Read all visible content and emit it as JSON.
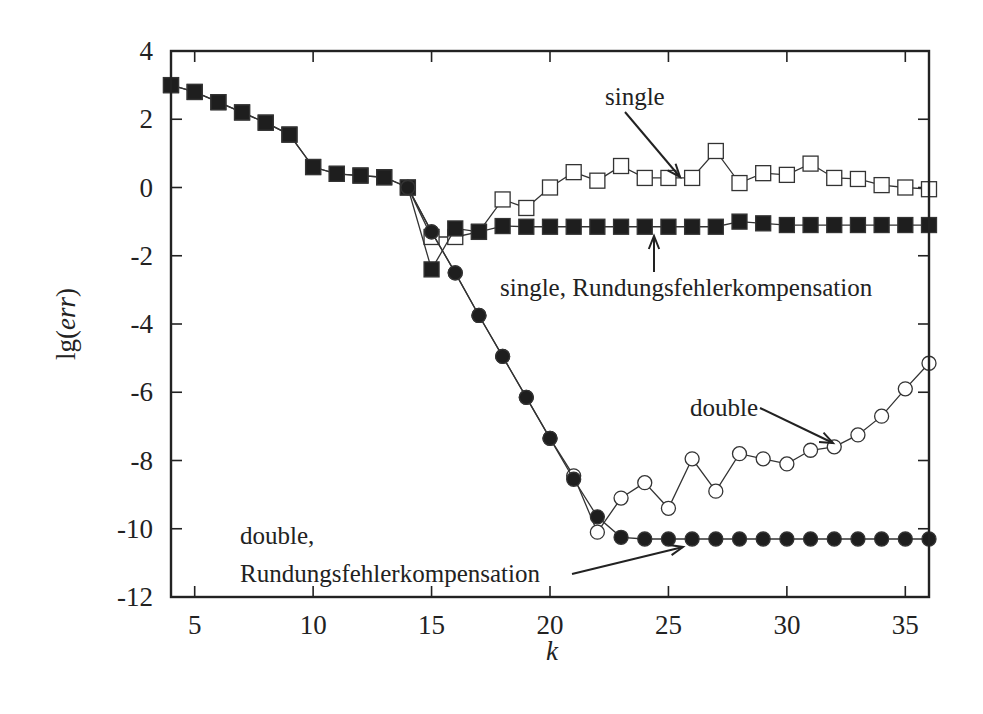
{
  "chart_data": {
    "type": "line",
    "title": "",
    "xlabel": "k",
    "ylabel": "lg(err)",
    "xlim": [
      4,
      36
    ],
    "ylim": [
      -12,
      4
    ],
    "xticks": [
      5,
      10,
      15,
      20,
      25,
      30,
      35
    ],
    "yticks": [
      4,
      2,
      0,
      -2,
      -4,
      -6,
      -8,
      -10,
      -12
    ],
    "grid": false,
    "legend": "none (inline annotations with arrows)",
    "series": [
      {
        "name": "single",
        "marker": "open-square",
        "x": [
          4,
          5,
          6,
          7,
          8,
          9,
          10,
          11,
          12,
          13,
          14,
          15,
          16,
          17,
          18,
          19,
          20,
          21,
          22,
          23,
          24,
          25,
          26,
          27,
          28,
          29,
          30,
          31,
          32,
          33,
          34,
          35,
          36
        ],
        "values": [
          3.0,
          2.8,
          2.5,
          2.2,
          1.9,
          1.55,
          0.6,
          0.4,
          0.35,
          0.3,
          0.0,
          -1.45,
          -1.45,
          -1.3,
          -0.35,
          -0.6,
          0.0,
          0.45,
          0.2,
          0.63,
          0.28,
          0.28,
          0.28,
          1.07,
          0.13,
          0.42,
          0.37,
          0.7,
          0.28,
          0.25,
          0.07,
          0.0,
          -0.05
        ]
      },
      {
        "name": "single, Rundungsfehlerkompensation",
        "marker": "filled-square",
        "x": [
          4,
          5,
          6,
          7,
          8,
          9,
          10,
          11,
          12,
          13,
          14,
          15,
          16,
          17,
          18,
          19,
          20,
          21,
          22,
          23,
          24,
          25,
          26,
          27,
          28,
          29,
          30,
          31,
          32,
          33,
          34,
          35,
          36
        ],
        "values": [
          3.0,
          2.8,
          2.5,
          2.2,
          1.9,
          1.55,
          0.6,
          0.4,
          0.35,
          0.3,
          0.0,
          -2.4,
          -1.2,
          -1.3,
          -1.13,
          -1.15,
          -1.15,
          -1.15,
          -1.15,
          -1.15,
          -1.15,
          -1.15,
          -1.15,
          -1.15,
          -1.0,
          -1.05,
          -1.1,
          -1.1,
          -1.1,
          -1.1,
          -1.1,
          -1.1,
          -1.1
        ]
      },
      {
        "name": "double",
        "marker": "open-circle",
        "x": [
          14,
          15,
          16,
          17,
          18,
          19,
          20,
          21,
          22,
          23,
          24,
          25,
          26,
          27,
          28,
          29,
          30,
          31,
          32,
          33,
          34,
          35,
          36
        ],
        "values": [
          0.0,
          -1.3,
          -2.5,
          -3.75,
          -4.95,
          -6.15,
          -7.35,
          -8.45,
          -10.1,
          -9.1,
          -8.65,
          -9.4,
          -7.95,
          -8.9,
          -7.8,
          -7.95,
          -8.1,
          -7.7,
          -7.6,
          -7.25,
          -6.7,
          -5.9,
          -5.15
        ]
      },
      {
        "name": "double, Rundungsfehlerkompensation",
        "marker": "filled-circle",
        "x": [
          14,
          15,
          16,
          17,
          18,
          19,
          20,
          21,
          22,
          23,
          24,
          25,
          26,
          27,
          28,
          29,
          30,
          31,
          32,
          33,
          34,
          35,
          36
        ],
        "values": [
          0.0,
          -1.3,
          -2.5,
          -3.75,
          -4.95,
          -6.15,
          -7.35,
          -8.55,
          -9.65,
          -10.25,
          -10.3,
          -10.3,
          -10.3,
          -10.3,
          -10.3,
          -10.3,
          -10.3,
          -10.3,
          -10.3,
          -10.3,
          -10.3,
          -10.3,
          -10.3
        ]
      }
    ],
    "annotations": [
      {
        "text": "single",
        "text_pos": [
          605,
          105
        ],
        "arrow_from": [
          625,
          112
        ],
        "arrow_to": [
          680,
          177
        ]
      },
      {
        "text": "single, Rundungsfehlerkompensation",
        "text_pos": [
          500,
          296
        ],
        "arrow_from": [
          654,
          272
        ],
        "arrow_to": [
          654,
          236
        ]
      },
      {
        "text": "double",
        "text_pos": [
          690,
          416
        ],
        "arrow_from": [
          760,
          408
        ],
        "arrow_to": [
          833,
          443
        ]
      },
      {
        "text": "double,",
        "text_pos": [
          240,
          544
        ],
        "arrow_from": null,
        "arrow_to": null
      },
      {
        "text": "Rundungsfehlerkompensation",
        "text_pos": [
          240,
          582
        ],
        "arrow_from": [
          572,
          574
        ],
        "arrow_to": [
          683,
          547
        ]
      }
    ]
  },
  "axes": {
    "x_title": "k",
    "y_title_prefix": "lg(",
    "y_title_var": "err",
    "y_title_suffix": ")"
  },
  "colors": {
    "ink": "#222222",
    "line": "#333333",
    "background": "#ffffff"
  }
}
